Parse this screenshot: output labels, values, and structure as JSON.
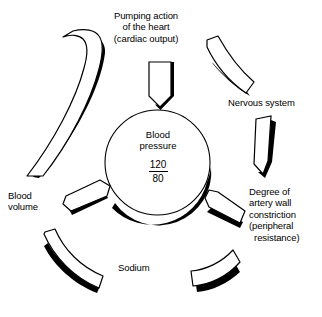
{
  "diagram": {
    "title_center": {
      "line1": "Blood",
      "line2": "pressure",
      "systolic": "120",
      "diastolic": "80"
    },
    "factors": [
      {
        "id": "pumping-action",
        "label": "Pumping action\nof the heart\n(cardiac output)",
        "position": "top",
        "arrow": "down-arrow"
      },
      {
        "id": "nervous-system",
        "label": "Nervous system",
        "position": "top-right",
        "arrow": "curved-band-down-left"
      },
      {
        "id": "artery-wall-constriction",
        "label": "Degree of\nartery wall\nconstriction\n(peripheral\n  resistance)",
        "position": "right",
        "arrow": "down-arrow-tapered"
      },
      {
        "id": "sodium",
        "label": "Sodium",
        "position": "bottom",
        "arrow": "curved-band-up"
      },
      {
        "id": "blood-volume",
        "label": "Blood\nvolume",
        "position": "left",
        "arrow": "long-curved-band"
      }
    ],
    "colors": {
      "ink": "#000000",
      "paper": "#ffffff",
      "shadow": "#000000"
    }
  }
}
